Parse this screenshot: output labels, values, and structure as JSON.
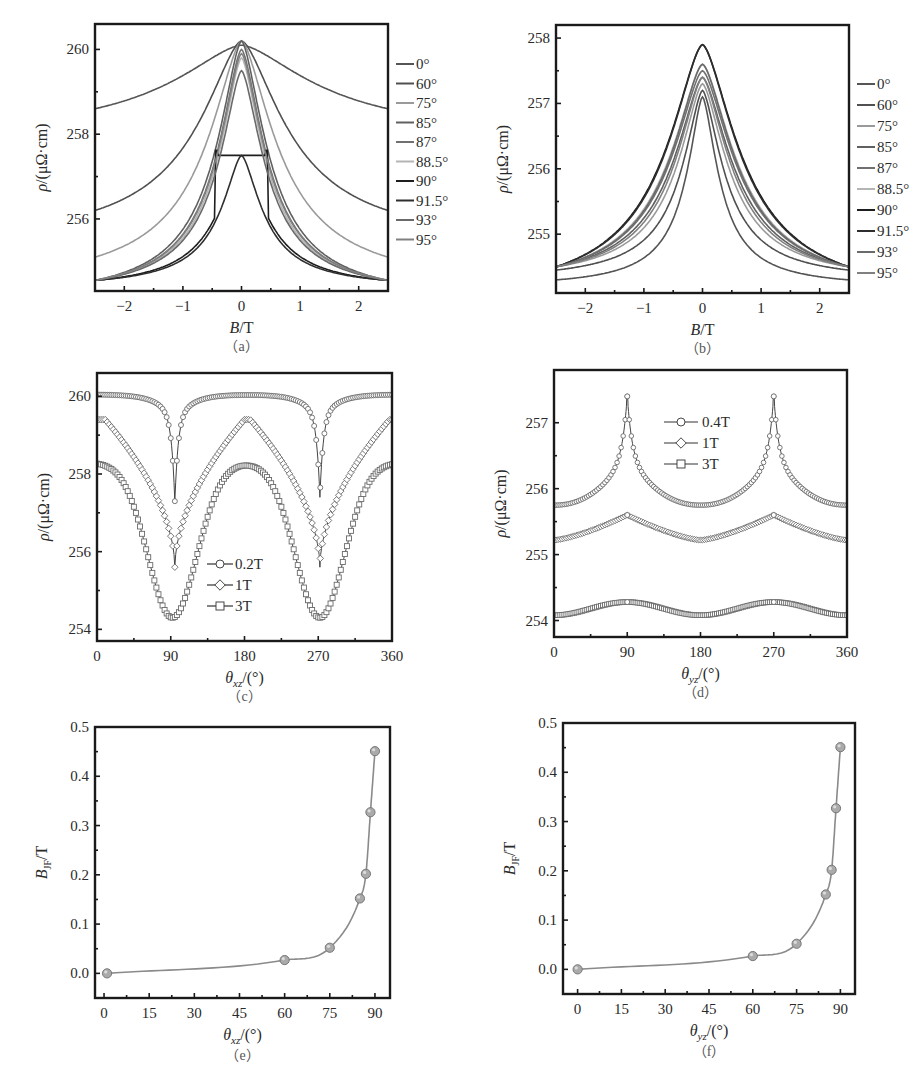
{
  "chart_data": [
    {
      "id": "a",
      "type": "line",
      "caption": "（a）",
      "xlabel": "B/T",
      "ylabel": "ρ/(μΩ·cm)",
      "xlim": [
        -2.5,
        2.5
      ],
      "ylim": [
        254.3,
        260.6
      ],
      "xticks": [
        -2,
        -1,
        0,
        1,
        2
      ],
      "xtick_labels": [
        "−2",
        "−1",
        "0",
        "1",
        "2"
      ],
      "yticks": [
        256,
        258,
        260
      ],
      "ytick_labels": [
        "256",
        "258",
        "260"
      ],
      "legend": [
        "0°",
        "60°",
        "75°",
        "85°",
        "87°",
        "88.5°",
        "90°",
        "91.5°",
        "93°",
        "95°"
      ],
      "legend_position": "outside-right",
      "series": [
        {
          "name": "0°",
          "color": "#555555",
          "peak": 260.1,
          "edge": 258.6,
          "width": 1.6
        },
        {
          "name": "60°",
          "color": "#505050",
          "peak": 260.2,
          "edge": 256.2,
          "width": 0.95
        },
        {
          "name": "75°",
          "color": "#9a9a9a",
          "peak": 260.2,
          "edge": 255.1,
          "width": 0.75
        },
        {
          "name": "85°",
          "color": "#606060",
          "peak": 260.2,
          "edge": 254.55,
          "width": 0.55
        },
        {
          "name": "87°",
          "color": "#707070",
          "peak": 260.0,
          "edge": 254.55,
          "width": 0.52
        },
        {
          "name": "88.5°",
          "color": "#b5b5b5",
          "peak": 259.8,
          "edge": 254.55,
          "width": 0.5
        },
        {
          "name": "90°",
          "color": "#1e1e1e",
          "peak": 257.5,
          "edge": 254.55,
          "width": 0.5,
          "plateau": 257.5,
          "plateau_halfwidth": 0.45
        },
        {
          "name": "91.5°",
          "color": "#2e2e2e",
          "peak": 257.5,
          "edge": 254.55,
          "width": 0.45
        },
        {
          "name": "93°",
          "color": "#6a6a6a",
          "peak": 259.5,
          "edge": 254.55,
          "width": 0.5
        },
        {
          "name": "95°",
          "color": "#808080",
          "peak": 259.9,
          "edge": 254.55,
          "width": 0.52
        }
      ]
    },
    {
      "id": "b",
      "type": "line",
      "caption": "（b）",
      "xlabel": "B/T",
      "ylabel": "ρ/(μΩ·cm)",
      "xlim": [
        -2.5,
        2.5
      ],
      "ylim": [
        254.1,
        258.2
      ],
      "xticks": [
        -2,
        -1,
        0,
        1,
        2
      ],
      "xtick_labels": [
        "−2",
        "−1",
        "0",
        "1",
        "2"
      ],
      "yticks": [
        255,
        256,
        257,
        258
      ],
      "ytick_labels": [
        "255",
        "256",
        "257",
        "258"
      ],
      "legend": [
        "0°",
        "60°",
        "75°",
        "85°",
        "87°",
        "88.5°",
        "90°",
        "91.5°",
        "93°",
        "95°"
      ],
      "legend_position": "outside-right",
      "series": [
        {
          "name": "0°",
          "color": "#555555",
          "peak": 257.1,
          "edge": 254.3,
          "width": 0.35
        },
        {
          "name": "60°",
          "color": "#505050",
          "peak": 257.2,
          "edge": 254.45,
          "width": 0.45
        },
        {
          "name": "75°",
          "color": "#9a9a9a",
          "peak": 257.3,
          "edge": 254.5,
          "width": 0.55
        },
        {
          "name": "85°",
          "color": "#606060",
          "peak": 257.4,
          "edge": 254.5,
          "width": 0.65
        },
        {
          "name": "87°",
          "color": "#707070",
          "peak": 257.5,
          "edge": 254.5,
          "width": 0.7
        },
        {
          "name": "88.5°",
          "color": "#b5b5b5",
          "peak": 257.6,
          "edge": 254.5,
          "width": 0.72
        },
        {
          "name": "90°",
          "color": "#1e1e1e",
          "peak": 257.9,
          "edge": 254.5,
          "width": 0.8
        },
        {
          "name": "91.5°",
          "color": "#2e2e2e",
          "peak": 257.9,
          "edge": 254.5,
          "width": 0.78
        },
        {
          "name": "93°",
          "color": "#6a6a6a",
          "peak": 257.6,
          "edge": 254.5,
          "width": 0.7
        },
        {
          "name": "95°",
          "color": "#808080",
          "peak": 257.4,
          "edge": 254.5,
          "width": 0.6
        }
      ]
    },
    {
      "id": "c",
      "type": "scatter",
      "caption": "（c）",
      "xlabel": "θxz/(°)",
      "xlabel_main": "θ",
      "xlabel_sub": "xz",
      "xlabel_rest": "/(°)",
      "ylabel": "ρ/(μΩ·cm)",
      "xlim": [
        0,
        360
      ],
      "ylim": [
        253.7,
        260.6
      ],
      "xticks": [
        0,
        90,
        180,
        270,
        360
      ],
      "xtick_labels": [
        "0",
        "90",
        "180",
        "270",
        "360"
      ],
      "yticks": [
        254,
        256,
        258,
        260
      ],
      "ytick_labels": [
        "254",
        "256",
        "258",
        "260"
      ],
      "legend": [
        "0.2T",
        "1T",
        "3T"
      ],
      "legend_position": "lower-center",
      "series": [
        {
          "name": "0.2T",
          "marker": "circle",
          "baseline": 260.05,
          "dips": [
            {
              "x": 95,
              "y": 257.3
            },
            {
              "x": 272,
              "y": 257.4
            }
          ],
          "dip_width": 12
        },
        {
          "name": "1T",
          "marker": "diamond",
          "baseline": 259.4,
          "dips": [
            {
              "x": 95,
              "y": 255.6
            },
            {
              "x": 272,
              "y": 255.6
            }
          ],
          "dip_width": 60
        },
        {
          "name": "3T",
          "marker": "square",
          "baseline": 258.3,
          "dips": [
            {
              "x": 92,
              "y": 254.3
            },
            {
              "x": 272,
              "y": 254.3
            }
          ],
          "dip_width": 80
        }
      ]
    },
    {
      "id": "d",
      "type": "scatter",
      "caption": "（d）",
      "xlabel": "θyz/(°)",
      "xlabel_main": "θ",
      "xlabel_sub": "yz",
      "xlabel_rest": "/(°)",
      "ylabel": "ρ/(μΩ·cm)",
      "xlim": [
        0,
        360
      ],
      "ylim": [
        253.75,
        257.8
      ],
      "xticks": [
        0,
        90,
        180,
        270,
        360
      ],
      "xtick_labels": [
        "0",
        "90",
        "180",
        "270",
        "360"
      ],
      "yticks": [
        254,
        255,
        256,
        257
      ],
      "ytick_labels": [
        "254",
        "255",
        "256",
        "257"
      ],
      "legend": [
        "0.4T",
        "1T",
        "3T"
      ],
      "legend_position": "upper-center",
      "series": [
        {
          "name": "0.4T",
          "marker": "circle",
          "min": 255.75,
          "peaks": [
            {
              "x": 90,
              "y": 257.4
            },
            {
              "x": 270,
              "y": 257.4
            }
          ],
          "shape": "cusp"
        },
        {
          "name": "1T",
          "marker": "diamond",
          "min": 255.22,
          "peaks": [
            {
              "x": 90,
              "y": 255.6
            },
            {
              "x": 270,
              "y": 255.6
            }
          ],
          "shape": "soft-cusp"
        },
        {
          "name": "3T",
          "marker": "square",
          "min": 254.08,
          "peaks": [
            {
              "x": 90,
              "y": 254.28
            },
            {
              "x": 270,
              "y": 254.28
            }
          ],
          "shape": "sine"
        }
      ]
    },
    {
      "id": "e",
      "type": "line",
      "caption": "（e）",
      "xlabel": "θxz/(°)",
      "xlabel_main": "θ",
      "xlabel_sub": "xz",
      "xlabel_rest": "/(°)",
      "ylabel": "BJF/T",
      "ylabel_main": "B",
      "ylabel_sub": "JF",
      "ylabel_rest": "/T",
      "xlim": [
        -3,
        95
      ],
      "ylim": [
        -0.05,
        0.5
      ],
      "xticks": [
        0,
        15,
        30,
        45,
        60,
        75,
        90
      ],
      "xtick_labels": [
        "0",
        "15",
        "30",
        "45",
        "60",
        "75",
        "90"
      ],
      "yticks": [
        0.0,
        0.1,
        0.2,
        0.3,
        0.4,
        0.5
      ],
      "ytick_labels": [
        "0.0",
        "0.1",
        "0.2",
        "0.3",
        "0.4",
        "0.5"
      ],
      "x": [
        1,
        60,
        75,
        85,
        87,
        88.5,
        90
      ],
      "y": [
        0.0,
        0.027,
        0.052,
        0.152,
        0.202,
        0.327,
        0.451
      ]
    },
    {
      "id": "f",
      "type": "line",
      "caption": "（f）",
      "xlabel": "θyz/(°)",
      "xlabel_main": "θ",
      "xlabel_sub": "yz",
      "xlabel_rest": "/(°)",
      "ylabel": "BJF/T",
      "ylabel_main": "B",
      "ylabel_sub": "JF",
      "ylabel_rest": "/T",
      "xlim": [
        -5,
        95
      ],
      "ylim": [
        -0.05,
        0.5
      ],
      "xticks": [
        0,
        15,
        30,
        45,
        60,
        75,
        90
      ],
      "xtick_labels": [
        "0",
        "15",
        "30",
        "45",
        "60",
        "75",
        "90"
      ],
      "yticks": [
        0.0,
        0.1,
        0.2,
        0.3,
        0.4,
        0.5
      ],
      "ytick_labels": [
        "0.0",
        "0.1",
        "0.2",
        "0.3",
        "0.4",
        "0.5"
      ],
      "x": [
        0,
        60,
        75,
        85,
        87,
        88.5,
        90
      ],
      "y": [
        0.0,
        0.027,
        0.052,
        0.152,
        0.202,
        0.327,
        0.451
      ]
    }
  ],
  "layout": {
    "frames": {
      "a": {
        "x": 95,
        "y": 24,
        "w": 293,
        "h": 267
      },
      "b": {
        "x": 556,
        "y": 25,
        "w": 293,
        "h": 268
      },
      "c": {
        "x": 97,
        "y": 373,
        "w": 295,
        "h": 268
      },
      "d": {
        "x": 554,
        "y": 370,
        "w": 293,
        "h": 267
      },
      "e": {
        "x": 95,
        "y": 727,
        "w": 295,
        "h": 271
      },
      "f": {
        "x": 563,
        "y": 723,
        "w": 292,
        "h": 271
      }
    },
    "colors": {
      "marker_fill": "#aaaaaa",
      "marker_edge": "#777777",
      "fit_line": "#8a8a8a",
      "open_marker": "#6a6a6a"
    }
  }
}
